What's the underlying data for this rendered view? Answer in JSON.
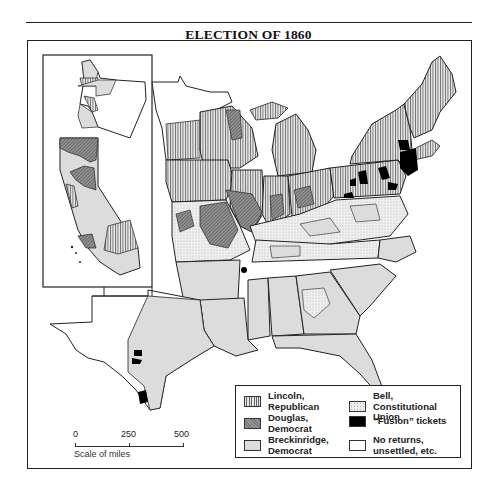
{
  "title": "ELECTION OF 1860",
  "legend": {
    "items": [
      {
        "key": "lincoln",
        "label": "Lincoln,\nRepublican",
        "pattern": "vertical-hatch"
      },
      {
        "key": "bell",
        "label": "Bell,\nConstitutional Union",
        "pattern": "stipple"
      },
      {
        "key": "douglas",
        "label": "Douglas,\nDemocrat",
        "pattern": "dark-crosshatch"
      },
      {
        "key": "fusion",
        "label": "“Fusion” tickets",
        "pattern": "solid-black"
      },
      {
        "key": "breckinridge",
        "label": "Breckinridge,\nDemocrat",
        "pattern": "light-gray"
      },
      {
        "key": "none",
        "label": "No returns,\nunsettled, etc.",
        "pattern": "white"
      }
    ]
  },
  "scale": {
    "ticks": [
      "0",
      "250",
      "500"
    ],
    "caption": "Scale of miles"
  },
  "colors": {
    "lincoln_stripe": "#666666",
    "douglas": "#808080",
    "breckinridge": "#dcdcdc",
    "bell": "#eeeeee",
    "fusion": "#000000",
    "border": "#222222"
  },
  "map": {
    "inset": "Pacific coast (Oregon, California)",
    "regions": [
      {
        "region": "New England",
        "winner": "lincoln"
      },
      {
        "region": "New York / Pennsylvania",
        "winner": "lincoln",
        "notes": "fusion counties in NY & NJ"
      },
      {
        "region": "Great Lakes / Midwest",
        "winner": "lincoln",
        "notes": "Douglas counties in IL, IN, OH"
      },
      {
        "region": "Missouri",
        "winner": "douglas"
      },
      {
        "region": "Border states (KY, TN, VA)",
        "winner": "bell"
      },
      {
        "region": "Deep South",
        "winner": "breckinridge"
      },
      {
        "region": "Texas",
        "winner": "breckinridge",
        "notes": "fusion counties in south Texas"
      },
      {
        "region": "California / Oregon inset",
        "winner": "mixed"
      }
    ]
  }
}
